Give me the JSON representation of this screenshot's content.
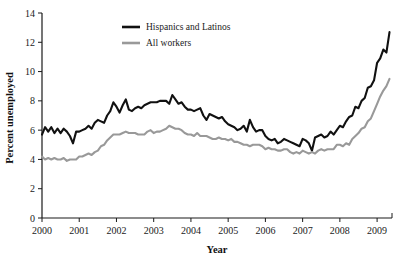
{
  "chart_data": {
    "type": "line",
    "title": "",
    "xlabel": "Year",
    "ylabel": "Percent unemployed",
    "xlim": [
      2000.0,
      2009.4
    ],
    "ylim": [
      0,
      14
    ],
    "yticks": [
      0,
      2,
      4,
      6,
      8,
      10,
      12,
      14
    ],
    "xticks": [
      2000,
      2001,
      2002,
      2003,
      2004,
      2005,
      2006,
      2007,
      2008,
      2009
    ],
    "xtick_labels": [
      "2000",
      "2001",
      "2002",
      "2003",
      "2004",
      "2005",
      "2006",
      "2007",
      "2008",
      "2009"
    ],
    "ytick_labels": [
      "0",
      "2",
      "4",
      "6",
      "8",
      "10",
      "12",
      "14"
    ],
    "grid": false,
    "legend_position": "top-center",
    "series": [
      {
        "name": "Hispanics and Latinos",
        "color": "#111111",
        "width": 2.1,
        "x": [
          2000.0,
          2000.083,
          2000.167,
          2000.25,
          2000.333,
          2000.417,
          2000.5,
          2000.583,
          2000.667,
          2000.75,
          2000.833,
          2000.917,
          2001.0,
          2001.083,
          2001.167,
          2001.25,
          2001.333,
          2001.417,
          2001.5,
          2001.583,
          2001.667,
          2001.75,
          2001.833,
          2001.917,
          2002.0,
          2002.083,
          2002.167,
          2002.25,
          2002.333,
          2002.417,
          2002.5,
          2002.583,
          2002.667,
          2002.75,
          2002.833,
          2002.917,
          2003.0,
          2003.083,
          2003.167,
          2003.25,
          2003.333,
          2003.417,
          2003.5,
          2003.583,
          2003.667,
          2003.75,
          2003.833,
          2003.917,
          2004.0,
          2004.083,
          2004.167,
          2004.25,
          2004.333,
          2004.417,
          2004.5,
          2004.583,
          2004.667,
          2004.75,
          2004.833,
          2004.917,
          2005.0,
          2005.083,
          2005.167,
          2005.25,
          2005.333,
          2005.417,
          2005.5,
          2005.583,
          2005.667,
          2005.75,
          2005.833,
          2005.917,
          2006.0,
          2006.083,
          2006.167,
          2006.25,
          2006.333,
          2006.417,
          2006.5,
          2006.583,
          2006.667,
          2006.75,
          2006.833,
          2006.917,
          2007.0,
          2007.083,
          2007.167,
          2007.25,
          2007.333,
          2007.417,
          2007.5,
          2007.583,
          2007.667,
          2007.75,
          2007.833,
          2007.917,
          2008.0,
          2008.083,
          2008.167,
          2008.25,
          2008.333,
          2008.417,
          2008.5,
          2008.583,
          2008.667,
          2008.75,
          2008.833,
          2008.917,
          2009.0,
          2009.083,
          2009.167,
          2009.25,
          2009.333
        ],
        "values": [
          5.7,
          6.2,
          5.9,
          6.2,
          5.8,
          6.1,
          5.8,
          6.1,
          5.9,
          5.6,
          5.1,
          5.9,
          5.9,
          6.0,
          6.1,
          6.3,
          6.1,
          6.5,
          6.7,
          6.6,
          6.5,
          7.0,
          7.3,
          7.9,
          7.6,
          7.2,
          7.7,
          8.1,
          7.4,
          7.3,
          7.5,
          7.6,
          7.5,
          7.7,
          7.8,
          7.9,
          7.9,
          7.9,
          8.0,
          8.0,
          8.0,
          7.8,
          8.4,
          8.1,
          7.8,
          7.9,
          7.6,
          7.4,
          7.4,
          7.3,
          7.4,
          7.5,
          7.0,
          6.7,
          7.1,
          7.0,
          6.9,
          6.8,
          6.9,
          6.6,
          6.4,
          6.3,
          6.2,
          6.0,
          6.1,
          6.3,
          5.9,
          6.7,
          6.2,
          5.9,
          6.0,
          6.0,
          5.6,
          5.4,
          5.3,
          5.4,
          5.1,
          5.2,
          5.4,
          5.3,
          5.2,
          5.1,
          5.0,
          4.9,
          5.4,
          5.3,
          5.1,
          4.6,
          5.5,
          5.6,
          5.7,
          5.5,
          5.6,
          5.9,
          5.7,
          6.0,
          6.3,
          6.2,
          6.6,
          6.9,
          7.0,
          7.6,
          7.5,
          8.0,
          8.2,
          8.9,
          9.0,
          9.4,
          10.6,
          10.9,
          11.5,
          11.3,
          12.7
        ]
      },
      {
        "name": "All workers",
        "color": "#999999",
        "width": 2.1,
        "x": [
          2000.0,
          2000.083,
          2000.167,
          2000.25,
          2000.333,
          2000.417,
          2000.5,
          2000.583,
          2000.667,
          2000.75,
          2000.833,
          2000.917,
          2001.0,
          2001.083,
          2001.167,
          2001.25,
          2001.333,
          2001.417,
          2001.5,
          2001.583,
          2001.667,
          2001.75,
          2001.833,
          2001.917,
          2002.0,
          2002.083,
          2002.167,
          2002.25,
          2002.333,
          2002.417,
          2002.5,
          2002.583,
          2002.667,
          2002.75,
          2002.833,
          2002.917,
          2003.0,
          2003.083,
          2003.167,
          2003.25,
          2003.333,
          2003.417,
          2003.5,
          2003.583,
          2003.667,
          2003.75,
          2003.833,
          2003.917,
          2004.0,
          2004.083,
          2004.167,
          2004.25,
          2004.333,
          2004.417,
          2004.5,
          2004.583,
          2004.667,
          2004.75,
          2004.833,
          2004.917,
          2005.0,
          2005.083,
          2005.167,
          2005.25,
          2005.333,
          2005.417,
          2005.5,
          2005.583,
          2005.667,
          2005.75,
          2005.833,
          2005.917,
          2006.0,
          2006.083,
          2006.167,
          2006.25,
          2006.333,
          2006.417,
          2006.5,
          2006.583,
          2006.667,
          2006.75,
          2006.833,
          2006.917,
          2007.0,
          2007.083,
          2007.167,
          2007.25,
          2007.333,
          2007.417,
          2007.5,
          2007.583,
          2007.667,
          2007.75,
          2007.833,
          2007.917,
          2008.0,
          2008.083,
          2008.167,
          2008.25,
          2008.333,
          2008.417,
          2008.5,
          2008.583,
          2008.667,
          2008.75,
          2008.833,
          2008.917,
          2009.0,
          2009.083,
          2009.167,
          2009.25,
          2009.333
        ],
        "values": [
          4.2,
          4.0,
          4.1,
          4.0,
          4.1,
          4.0,
          4.0,
          4.1,
          3.9,
          4.0,
          4.0,
          4.0,
          4.2,
          4.2,
          4.3,
          4.4,
          4.3,
          4.5,
          4.6,
          4.9,
          5.0,
          5.3,
          5.5,
          5.7,
          5.7,
          5.7,
          5.8,
          5.9,
          5.8,
          5.8,
          5.8,
          5.7,
          5.7,
          5.7,
          5.9,
          6.0,
          5.8,
          5.9,
          5.9,
          6.0,
          6.1,
          6.3,
          6.2,
          6.1,
          6.1,
          6.0,
          5.8,
          5.7,
          5.7,
          5.6,
          5.8,
          5.6,
          5.6,
          5.6,
          5.5,
          5.4,
          5.4,
          5.5,
          5.4,
          5.4,
          5.3,
          5.4,
          5.2,
          5.2,
          5.1,
          5.0,
          5.0,
          4.9,
          5.0,
          5.0,
          5.0,
          4.9,
          4.7,
          4.8,
          4.7,
          4.7,
          4.6,
          4.6,
          4.7,
          4.7,
          4.5,
          4.4,
          4.5,
          4.4,
          4.6,
          4.5,
          4.4,
          4.5,
          4.4,
          4.6,
          4.7,
          4.6,
          4.7,
          4.7,
          4.7,
          5.0,
          5.0,
          4.9,
          5.1,
          5.0,
          5.4,
          5.6,
          5.8,
          6.1,
          6.2,
          6.6,
          6.8,
          7.3,
          7.8,
          8.3,
          8.7,
          9.0,
          9.5
        ]
      }
    ],
    "legend": [
      {
        "label": "Hispanics and Latinos",
        "color": "#111111"
      },
      {
        "label": "All workers",
        "color": "#999999"
      }
    ]
  }
}
